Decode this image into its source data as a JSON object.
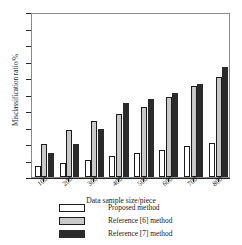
{
  "chart_data": {
    "type": "bar",
    "title": "",
    "xlabel": "Data sample size/piece",
    "ylabel": "Misclassification ratio/%",
    "categories": [
      "100",
      "200",
      "300",
      "400",
      "500",
      "600",
      "700",
      "800"
    ],
    "series": [
      {
        "name": "Proposed method",
        "color": "#ffffff",
        "values": [
          1.3,
          1.7,
          2.1,
          2.5,
          2.9,
          3.3,
          3.75,
          4.1
        ]
      },
      {
        "name": "Reference [6] method",
        "color": "#c9c9c9",
        "values": [
          4.0,
          5.7,
          6.8,
          7.6,
          8.5,
          9.7,
          11.0,
          12.1
        ]
      },
      {
        "name": "Reference [7] method",
        "color": "#2b2b2b",
        "values": [
          2.9,
          4.0,
          5.8,
          9.0,
          9.4,
          10.2,
          11.3,
          13.3
        ]
      }
    ],
    "ylim": [
      0,
      20
    ],
    "yticks": [
      0,
      2,
      4,
      6,
      8,
      10,
      12,
      14,
      16,
      18,
      20
    ],
    "ytick_labels": [
      "0",
      "2",
      "4",
      "6",
      "8",
      "10",
      "12",
      "14",
      "16",
      "18",
      "20"
    ],
    "grid": false,
    "legend_position": "below-axes"
  },
  "legend": {
    "entries": [
      {
        "label": "Proposed method",
        "swatch": "white-swatch"
      },
      {
        "label": "Reference [6] method",
        "swatch": "gray-swatch"
      },
      {
        "label": "Reference [7] method",
        "swatch": "black-swatch"
      }
    ]
  }
}
